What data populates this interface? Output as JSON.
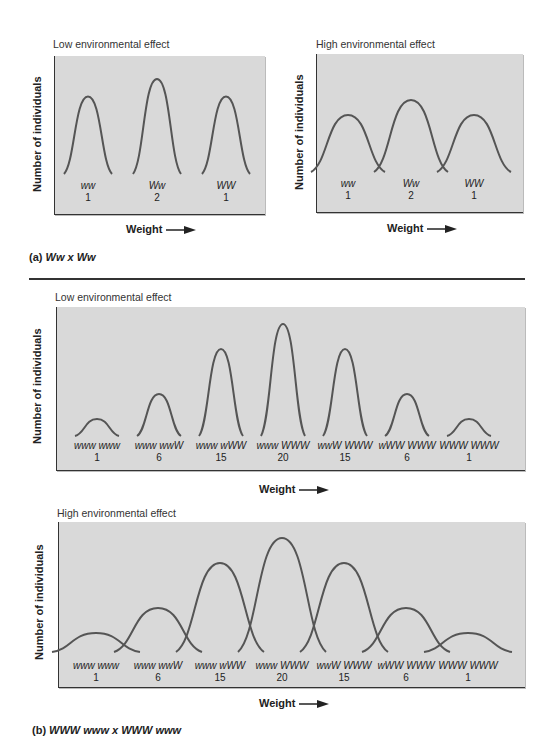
{
  "panel_a": {
    "caption_prefix": "(a)",
    "caption_cross": "Ww x Ww",
    "low": {
      "title": "Low environmental effect",
      "ylabel": "Number of individuals",
      "xlabel": "Weight",
      "classes": [
        {
          "genotype": "ww",
          "ratio": "1",
          "relative_height": 0.5,
          "spread": "narrow"
        },
        {
          "genotype": "Ww",
          "ratio": "2",
          "relative_height": 1.0,
          "spread": "narrow"
        },
        {
          "genotype": "WW",
          "ratio": "1",
          "relative_height": 0.5,
          "spread": "narrow"
        }
      ]
    },
    "high": {
      "title": "High environmental effect",
      "ylabel": "Number of individuals",
      "xlabel": "Weight",
      "classes": [
        {
          "genotype": "ww",
          "ratio": "1",
          "relative_height": 0.5,
          "spread": "wide"
        },
        {
          "genotype": "Ww",
          "ratio": "2",
          "relative_height": 1.0,
          "spread": "wide"
        },
        {
          "genotype": "WW",
          "ratio": "1",
          "relative_height": 0.5,
          "spread": "wide"
        }
      ]
    }
  },
  "panel_b": {
    "caption_prefix": "(b)",
    "caption_cross": "WWW www x WWW www",
    "low": {
      "title": "Low environmental effect",
      "ylabel": "Number of individuals",
      "xlabel": "Weight",
      "classes": [
        {
          "genotype": "www www",
          "ratio": "1"
        },
        {
          "genotype": "www wwW",
          "ratio": "6"
        },
        {
          "genotype": "www wWW",
          "ratio": "15"
        },
        {
          "genotype": "www WWW",
          "ratio": "20"
        },
        {
          "genotype": "wwW WWW",
          "ratio": "15"
        },
        {
          "genotype": "wWW WWW",
          "ratio": "6"
        },
        {
          "genotype": "WWW WWW",
          "ratio": "1"
        }
      ]
    },
    "high": {
      "title": "High environmental effect",
      "ylabel": "Number of individuals",
      "xlabel": "Weight",
      "classes": [
        {
          "genotype": "www www",
          "ratio": "1"
        },
        {
          "genotype": "www wwW",
          "ratio": "6"
        },
        {
          "genotype": "www wWW",
          "ratio": "15"
        },
        {
          "genotype": "www WWW",
          "ratio": "20"
        },
        {
          "genotype": "wwW WWW",
          "ratio": "15"
        },
        {
          "genotype": "wWW WWW",
          "ratio": "6"
        },
        {
          "genotype": "WWW WWW",
          "ratio": "1"
        }
      ]
    }
  }
}
